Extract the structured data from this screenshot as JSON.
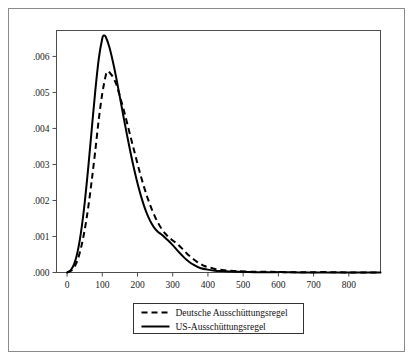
{
  "chart_data": {
    "type": "line",
    "title": "",
    "xlabel": "",
    "ylabel": "",
    "xlim": [
      -30,
      890
    ],
    "ylim": [
      0,
      0.00672
    ],
    "grid": false,
    "legend_position": "below-axes",
    "xticks": [
      "0",
      "100",
      "200",
      "300",
      "400",
      "500",
      "600",
      "700",
      "800"
    ],
    "xtick_values": [
      0,
      100,
      200,
      300,
      400,
      500,
      600,
      700,
      800
    ],
    "yticks": [
      ".000",
      ".001",
      ".002",
      ".003",
      ".004",
      ".005",
      ".006"
    ],
    "ytick_values": [
      0.0,
      0.001,
      0.002,
      0.003,
      0.004,
      0.005,
      0.006
    ],
    "series": [
      {
        "name": "Deutsche Ausschüttungsregel",
        "style": "dashed",
        "color": "#000000",
        "x": [
          0,
          10,
          20,
          30,
          40,
          50,
          60,
          70,
          80,
          90,
          100,
          110,
          115,
          120,
          130,
          140,
          150,
          160,
          170,
          180,
          190,
          200,
          210,
          220,
          230,
          240,
          250,
          260,
          270,
          280,
          290,
          300,
          310,
          320,
          330,
          340,
          350,
          360,
          370,
          380,
          390,
          400,
          420,
          440,
          460,
          480,
          500,
          540,
          580,
          620,
          660,
          700,
          750,
          800,
          850,
          890
        ],
        "y": [
          0.0,
          4e-05,
          0.00014,
          0.00035,
          0.0007,
          0.00118,
          0.0018,
          0.00255,
          0.00337,
          0.00425,
          0.00497,
          0.00548,
          0.00558,
          0.00556,
          0.00543,
          0.00522,
          0.00489,
          0.00455,
          0.00417,
          0.00378,
          0.0034,
          0.00302,
          0.00266,
          0.00233,
          0.00203,
          0.00177,
          0.00154,
          0.00135,
          0.00119,
          0.00107,
          0.00097,
          0.00089,
          0.00082,
          0.00073,
          0.00063,
          0.00053,
          0.00044,
          0.00036,
          0.00029,
          0.00023,
          0.00018,
          0.00015,
          0.0001,
          7e-05,
          5e-05,
          4e-05,
          3e-05,
          2e-05,
          2e-05,
          1e-05,
          1e-05,
          1e-05,
          1e-05,
          0.0,
          0.0,
          0.0
        ]
      },
      {
        "name": "US-Ausschüttungsregel",
        "style": "solid",
        "color": "#000000",
        "x": [
          0,
          10,
          20,
          30,
          40,
          50,
          60,
          70,
          80,
          90,
          100,
          105,
          110,
          120,
          130,
          140,
          150,
          160,
          170,
          180,
          190,
          200,
          210,
          220,
          230,
          240,
          250,
          260,
          265,
          270,
          280,
          290,
          300,
          310,
          320,
          330,
          340,
          350,
          360,
          370,
          380,
          400,
          420,
          440,
          460,
          480,
          500,
          540,
          580,
          620,
          660,
          700,
          750,
          800,
          850,
          890
        ],
        "y": [
          0.0,
          6e-05,
          0.00023,
          0.00058,
          0.00115,
          0.00193,
          0.0029,
          0.00397,
          0.00503,
          0.00593,
          0.0065,
          0.00658,
          0.00654,
          0.00626,
          0.00586,
          0.00539,
          0.00487,
          0.00434,
          0.00383,
          0.00334,
          0.00289,
          0.00248,
          0.00212,
          0.00181,
          0.00156,
          0.00136,
          0.00121,
          0.00111,
          0.00108,
          0.00104,
          0.00095,
          0.00086,
          0.00076,
          0.00065,
          0.00054,
          0.00044,
          0.00035,
          0.00027,
          0.00021,
          0.00016,
          0.00012,
          8e-05,
          5e-05,
          4e-05,
          3e-05,
          2e-05,
          2e-05,
          1e-05,
          1e-05,
          1e-05,
          0.0,
          0.0,
          0.0,
          0.0,
          0.0,
          0.0
        ]
      }
    ]
  },
  "legend": {
    "entries": [
      {
        "label": "Deutsche Ausschüttungsregel",
        "style": "dashed"
      },
      {
        "label": "US-Ausschüttungsregel",
        "style": "solid"
      }
    ]
  }
}
